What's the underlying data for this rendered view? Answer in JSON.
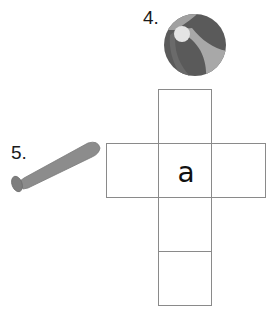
{
  "items": [
    {
      "number": "4.",
      "object": "beach ball"
    },
    {
      "number": "5.",
      "object": "baseball bat"
    }
  ],
  "net": {
    "shape": "cube net (cross layout, 6 squares)",
    "center_letter": "a"
  },
  "colors": {
    "grid_line": "#8a8a8a",
    "ball_dark": "#555555",
    "ball_light": "#a9a9a9",
    "ball_highlight": "#e2e2e2",
    "bat": "#8c8c8c"
  }
}
